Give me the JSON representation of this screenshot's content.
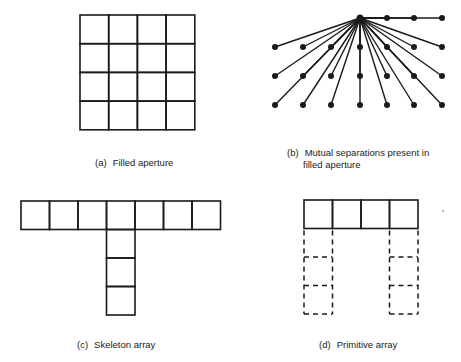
{
  "figure": {
    "panels": [
      {
        "id": "a",
        "tag": "(a)",
        "caption": "Filled aperture",
        "type": "grid",
        "rows": 4,
        "cols": 4
      },
      {
        "id": "b",
        "tag": "(b)",
        "caption_line1": "Mutual separations present in",
        "caption_line2": "filled aperture",
        "type": "vector-fan",
        "origin_row": 0,
        "origin_col": 3,
        "rows": 4,
        "cols": 7,
        "points_top_row_right": 3
      },
      {
        "id": "c",
        "tag": "(c)",
        "caption": "Skeleton array",
        "type": "t-shape",
        "top_row_cells": 7,
        "stem_cells": 3,
        "stem_col": 3
      },
      {
        "id": "d",
        "tag": "(d)",
        "caption": "Primitive array",
        "type": "primitive",
        "top_row_cells": 4,
        "dashed_columns": [
          0,
          3
        ],
        "dashed_cells_per_column": 3
      }
    ],
    "colors": {
      "line": "#1a1a1a",
      "background": "#ffffff"
    }
  }
}
